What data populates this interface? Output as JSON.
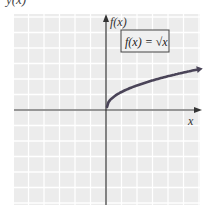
{
  "chart_data": {
    "type": "line",
    "title": "f(x) = √x",
    "function": "sqrt",
    "legend_label": "f(x) = √x",
    "xlabel": "x",
    "ylabel": "f(x)",
    "top_cut_label": "y(x)",
    "grid": true,
    "axis_arrows": true,
    "tick_labels": false,
    "grid_spacing_px": 15.5,
    "xlim_units": [
      -6,
      6
    ],
    "ylim_units": [
      -6,
      6
    ],
    "series": [
      {
        "name": "f(x) = √x",
        "x": [
          0,
          0.25,
          1,
          2,
          3,
          4,
          5,
          6
        ],
        "y": [
          0,
          0.5,
          1,
          1.41,
          1.73,
          2,
          2.24,
          2.45
        ]
      }
    ],
    "colors": {
      "grid_bg": "#ececec",
      "grid_line": "#ffffff",
      "axis": "#333333",
      "curve": "#4a4458",
      "label_box_border": "#444444"
    }
  }
}
